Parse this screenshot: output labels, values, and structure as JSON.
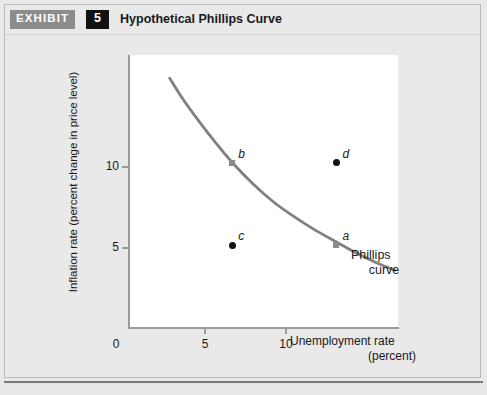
{
  "exhibit": {
    "tag": "EXHIBIT",
    "number": "5",
    "title": "Hypothetical Phillips Curve"
  },
  "chart_data": {
    "type": "line",
    "title": "Hypothetical Phillips Curve",
    "xlabel": "Unemployment rate",
    "xlabel_units": "(percent)",
    "ylabel": "Inflation rate (percent change in price level)",
    "xlim": [
      0,
      13
    ],
    "ylim": [
      0,
      16.5
    ],
    "xticks": [
      "0",
      "5",
      "10"
    ],
    "xtick_values": [
      0,
      5,
      10
    ],
    "yticks": [
      "5",
      "10"
    ],
    "ytick_values": [
      5,
      10
    ],
    "grid": false,
    "legend": "none",
    "series": [
      {
        "name": "Phillips curve",
        "annotation": "Phillips curve",
        "color": "#808080",
        "x": [
          2.0,
          2.6,
          3.4,
          4.2,
          5.0,
          6.0,
          7.0,
          8.0,
          9.0,
          10.0,
          11.0,
          12.0,
          12.8
        ],
        "y": [
          15.1,
          13.9,
          12.5,
          11.2,
          10.0,
          8.7,
          7.6,
          6.7,
          5.9,
          5.2,
          4.5,
          3.9,
          3.5
        ]
      }
    ],
    "points": [
      {
        "label": "a",
        "x": 10,
        "y": 5,
        "marker": "square",
        "color": "#8a8a8a",
        "on_curve": true
      },
      {
        "label": "b",
        "x": 5,
        "y": 10,
        "marker": "square",
        "color": "#8a8a8a",
        "on_curve": true
      },
      {
        "label": "c",
        "x": 5,
        "y": 5,
        "marker": "dot",
        "color": "#111111",
        "on_curve": false
      },
      {
        "label": "d",
        "x": 10,
        "y": 10,
        "marker": "dot",
        "color": "#111111",
        "on_curve": false
      }
    ]
  }
}
